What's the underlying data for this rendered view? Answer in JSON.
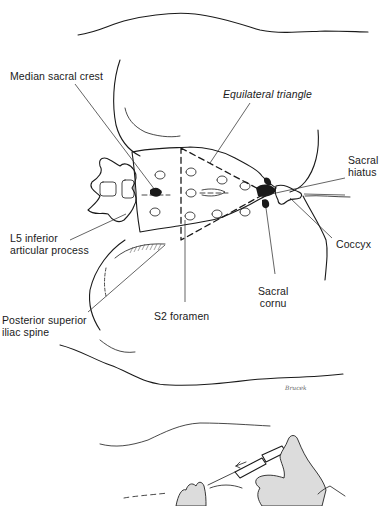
{
  "figure": {
    "labels": {
      "median_sacral_crest": "Median sacral crest",
      "equilateral_triangle": "Equilateral triangle",
      "sacral_hiatus": [
        "Sacral",
        "hiatus"
      ],
      "l5_inferior_articular_process": [
        "L5 inferior",
        "articular process"
      ],
      "coccyx": "Coccyx",
      "sacral_cornu": [
        "Sacral",
        "cornu"
      ],
      "s2_foramen": "S2 foramen",
      "posterior_superior_iliac_spine": [
        "Posterior superior",
        "iliac spine"
      ]
    },
    "signature": "Brucek"
  }
}
